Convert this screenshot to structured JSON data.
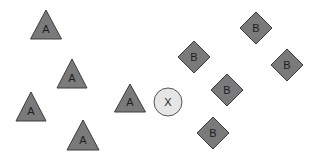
{
  "diagram": {
    "colors": {
      "background": "#ffffff",
      "class_fill": "#7a7a7a",
      "class_stroke": "#3c3c3c",
      "query_fill": "#e6e6e6",
      "query_stroke": "#555555",
      "label": "#1e1e1e"
    },
    "class_a": {
      "label": "A",
      "shape": "triangle",
      "points": [
        {
          "label": "A",
          "apex": [
            46,
            10
          ],
          "base_y": 39,
          "half_width": 15.5
        },
        {
          "label": "A",
          "apex": [
            72,
            59
          ],
          "base_y": 88,
          "half_width": 15
        },
        {
          "label": "A",
          "apex": [
            31,
            92
          ],
          "base_y": 121,
          "half_width": 15
        },
        {
          "label": "A",
          "apex": [
            83,
            120
          ],
          "base_y": 150,
          "half_width": 16
        },
        {
          "label": "A",
          "apex": [
            130,
            84
          ],
          "base_y": 112,
          "half_width": 15.5
        }
      ]
    },
    "class_b": {
      "label": "B",
      "shape": "diamond",
      "points": [
        {
          "label": "B",
          "center": [
            194,
            57
          ],
          "half_size": 16
        },
        {
          "label": "B",
          "center": [
            256,
            28
          ],
          "half_size": 16
        },
        {
          "label": "B",
          "center": [
            287,
            65
          ],
          "half_size": 16
        },
        {
          "label": "B",
          "center": [
            227,
            90
          ],
          "half_size": 16
        },
        {
          "label": "B",
          "center": [
            213,
            133
          ],
          "half_size": 16
        }
      ]
    },
    "query": {
      "label": "X",
      "shape": "circle",
      "center": [
        168,
        102
      ],
      "radius": 14
    }
  }
}
